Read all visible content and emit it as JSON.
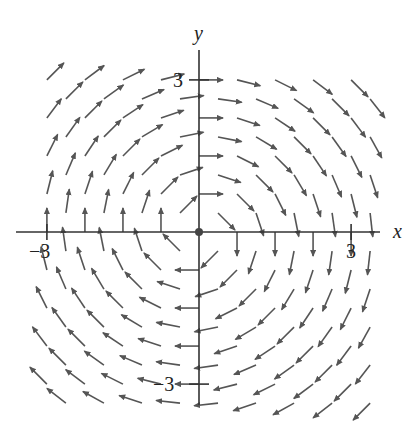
{
  "figure": {
    "type": "vector-field",
    "field": {
      "Fx": "y",
      "Fy": "-x",
      "description": "F(x, y) = y i - x j (clockwise rotation)"
    },
    "axes": {
      "x_label": "x",
      "y_label": "y",
      "x_ticks": [
        {
          "value": -3,
          "label": "-3"
        },
        {
          "value": 3,
          "label": "3"
        }
      ],
      "y_ticks": [
        {
          "value": 3,
          "label": "3"
        },
        {
          "value": -3,
          "label": "-3"
        }
      ],
      "range": [
        -3.8,
        3.5
      ]
    },
    "colors": {
      "axis": "#333333",
      "arrow": "#555555",
      "origin_dot": "#444444"
    }
  },
  "layout": {
    "origin_px": [
      199,
      232
    ],
    "unit_px": 50.7,
    "grid_step_units": 0.8,
    "arrow_len_px": 24
  }
}
